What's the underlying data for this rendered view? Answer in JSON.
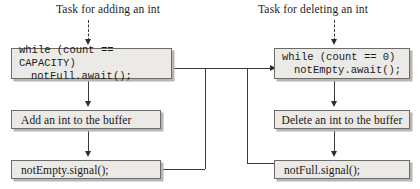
{
  "diagram": {
    "captions": [
      {
        "id": "add-task",
        "text": "Task for adding an int"
      },
      {
        "id": "delete-task",
        "text": "Task for deleting an int"
      }
    ],
    "left_column": {
      "wait_box": {
        "line1": "while (count == CAPACITY)",
        "line2": "notFull.await();"
      },
      "action_box": {
        "text": "Add an int to the buffer"
      },
      "signal_box": {
        "text": "notEmpty.signal();"
      }
    },
    "right_column": {
      "wait_box": {
        "line1": "while (count == 0)",
        "line2": "notEmpty.await();"
      },
      "action_box": {
        "text": "Delete an int to the buffer"
      },
      "signal_box": {
        "text": "notFull.signal();"
      }
    },
    "colors": {
      "box_fill": "#eceae6",
      "box_border": "#6d6b68",
      "box_shadow": "#b9b6b1",
      "connector": "#3a3a3a",
      "text": "#1a1a1a",
      "background": "#ffffff"
    }
  }
}
